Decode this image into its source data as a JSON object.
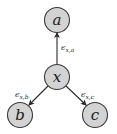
{
  "diagram": {
    "type": "directed-graph",
    "nodes": [
      {
        "id": "a",
        "label": "a",
        "cx": 57,
        "cy": 20
      },
      {
        "id": "x",
        "label": "x",
        "cx": 57,
        "cy": 77
      },
      {
        "id": "b",
        "label": "b",
        "cx": 20,
        "cy": 115
      },
      {
        "id": "c",
        "label": "c",
        "cx": 95,
        "cy": 115
      }
    ],
    "edges": [
      {
        "from": "x",
        "to": "a",
        "label_main": "ϵ",
        "label_sub": "x,a"
      },
      {
        "from": "x",
        "to": "b",
        "label_main": "ϵ",
        "label_sub": "x,b"
      },
      {
        "from": "x",
        "to": "c",
        "label_main": "ϵ",
        "label_sub": "x,c"
      }
    ],
    "colors": {
      "node_fill": "#d3d3d3",
      "node_stroke": "#3a3a3a",
      "edge": "#2a2a2a"
    }
  }
}
